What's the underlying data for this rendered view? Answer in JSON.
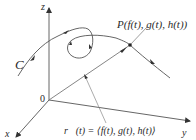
{
  "figure": {
    "axes": {
      "z_label": "z",
      "x_label": "x",
      "y_label": "y",
      "origin_label": "0"
    },
    "curve_label": "C",
    "point_label": "P(f(t), g(t), h(t))",
    "vector_label": "r⃗(t) = ⟨f(t), g(t), h(t)⟩",
    "colors": {
      "stroke": "#555555",
      "text": "#2a2a2a",
      "background": "#ffffff"
    }
  }
}
